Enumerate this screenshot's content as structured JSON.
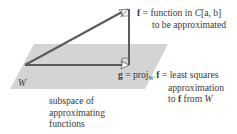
{
  "diagram": {
    "plane_label": "W",
    "f_label": {
      "symbol": "f",
      "line1_rest": " = function in ",
      "space": "C",
      "interval": "[a, b]",
      "line2": "to be approximated"
    },
    "g_label": {
      "symbol": "g",
      "eq": " = proj",
      "proj_sub": "W",
      "f_symbol": "f",
      "line1_rest": " = least squares",
      "line2": "approximation",
      "line3_prefix": "to ",
      "line3_f": "f",
      "line3_mid": " from ",
      "line3_W": "W"
    },
    "subspace_caption": [
      "subspace of",
      "approximating",
      "functions"
    ],
    "colors": {
      "plane": "#d4d4d4",
      "vector": "#5a5a5a",
      "text": "#3a3a3a"
    }
  }
}
